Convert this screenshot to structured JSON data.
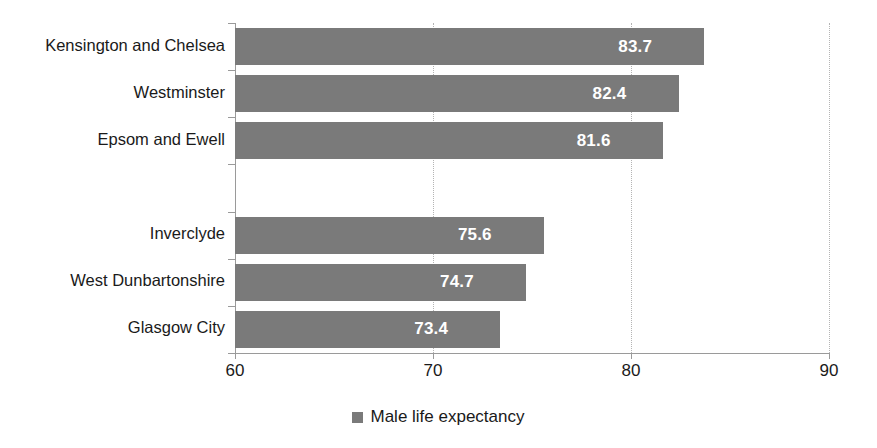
{
  "chart_data": {
    "type": "bar",
    "orientation": "horizontal",
    "title": "",
    "subtitle": "",
    "xlabel": "",
    "ylabel": "",
    "xlim": [
      60,
      90
    ],
    "xticks": [
      60,
      70,
      80,
      90
    ],
    "xtick_labels": [
      "60",
      "70",
      "80",
      "90"
    ],
    "grid": "vertical-dotted",
    "legend_position": "bottom-center",
    "legend": [
      "Male life expectancy"
    ],
    "series": [
      {
        "name": "Male life expectancy",
        "color": "#7a7a7a",
        "values": [
          83.7,
          82.4,
          81.6,
          null,
          75.6,
          74.7,
          73.4
        ]
      }
    ],
    "categories": [
      "Kensington and Chelsea",
      "Westminster",
      "Epsom and Ewell",
      "",
      "Inverclyde",
      "West Dunbartonshire",
      "Glasgow City"
    ],
    "data_labels": [
      "83.7",
      "82.4",
      "81.6",
      "",
      "75.6",
      "74.7",
      "73.4"
    ]
  },
  "rows": [
    {
      "category": "Kensington and Chelsea",
      "value": 83.7,
      "label": "83.7",
      "blank": false
    },
    {
      "category": "Westminster",
      "value": 82.4,
      "label": "82.4",
      "blank": false
    },
    {
      "category": "Epsom and Ewell",
      "value": 81.6,
      "label": "81.6",
      "blank": false
    },
    {
      "category": "",
      "value": null,
      "label": "",
      "blank": true
    },
    {
      "category": "Inverclyde",
      "value": 75.6,
      "label": "75.6",
      "blank": false
    },
    {
      "category": "West Dunbartonshire",
      "value": 74.7,
      "label": "74.7",
      "blank": false
    },
    {
      "category": "Glasgow City",
      "value": 73.4,
      "label": "73.4",
      "blank": false
    }
  ],
  "axis": {
    "x_min": 60,
    "x_max": 90,
    "ticks": [
      "60",
      "70",
      "80",
      "90"
    ]
  },
  "legend": {
    "swatch_color": "#7a7a7a",
    "label": "Male life expectancy"
  },
  "colors": {
    "bar": "#7a7a7a",
    "gridline": "#b4b4b4",
    "axis": "#9a9a9a",
    "text": "#1a1a1a",
    "data_label": "#ffffff",
    "background": "#ffffff"
  }
}
